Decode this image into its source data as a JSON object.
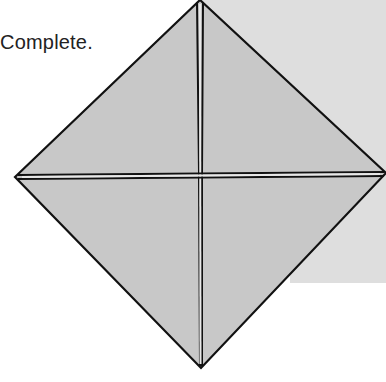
{
  "caption": "Complete.",
  "colors": {
    "paper_fill": "#c9c9c9",
    "background_sheet": "#dcdcdc",
    "line": "#111111",
    "crease_gap": "#e6e6e6"
  },
  "diagram": {
    "shape": "square-base diamond with center cross folds",
    "vertices": {
      "top": [
        200,
        0
      ],
      "left": [
        15,
        177
      ],
      "right": [
        386,
        173
      ],
      "bottom": [
        201,
        368
      ]
    },
    "center": [
      200,
      175
    ]
  }
}
